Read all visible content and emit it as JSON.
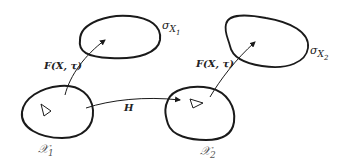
{
  "diagram": {
    "left_group": {
      "domain_label": "𝒳",
      "domain_subscript": "1",
      "image_label": "σ",
      "image_subscript": "X",
      "image_subscript2": "1",
      "map_label": "F(X, τ)"
    },
    "right_group": {
      "domain_label": "𝒳",
      "domain_subscript": "2",
      "image_label": "σ",
      "image_subscript": "X",
      "image_subscript2": "2",
      "map_label": "F(X, τ)"
    },
    "connector_label": "H",
    "colors": {
      "stroke": "#1a1a1a",
      "text": "#222222"
    }
  }
}
